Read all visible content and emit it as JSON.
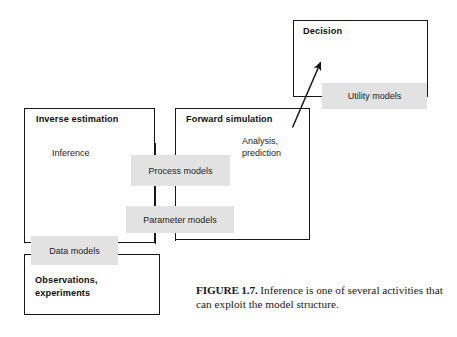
{
  "figure": {
    "containers": [
      {
        "id": "decision",
        "title": "Decision"
      },
      {
        "id": "inverse-estimation",
        "title": "Inverse estimation"
      },
      {
        "id": "forward-simulation",
        "title": "Forward simulation"
      },
      {
        "id": "observations",
        "title": "Observations,\nexperiments",
        "title_line1": "Observations,",
        "title_line2": "experiments"
      }
    ],
    "plain_labels": [
      {
        "id": "inference",
        "text": "Inference"
      },
      {
        "id": "analysis",
        "line1": "Analysis,",
        "line2": "prediction"
      }
    ],
    "model_boxes": [
      {
        "id": "utility-models",
        "label": "Utility models"
      },
      {
        "id": "process-models",
        "label": "Process models"
      },
      {
        "id": "parameter-models",
        "label": "Parameter models"
      },
      {
        "id": "data-models",
        "label": "Data models"
      }
    ],
    "caption": {
      "number": "FIGURE 1.7.",
      "text": " Inference is one of several activities that can exploit the model structure."
    },
    "colors": {
      "shaded_box_fill": "#e2e2e2",
      "outline": "#171717",
      "text": "#1b1b1b",
      "background": "#ffffff"
    }
  }
}
